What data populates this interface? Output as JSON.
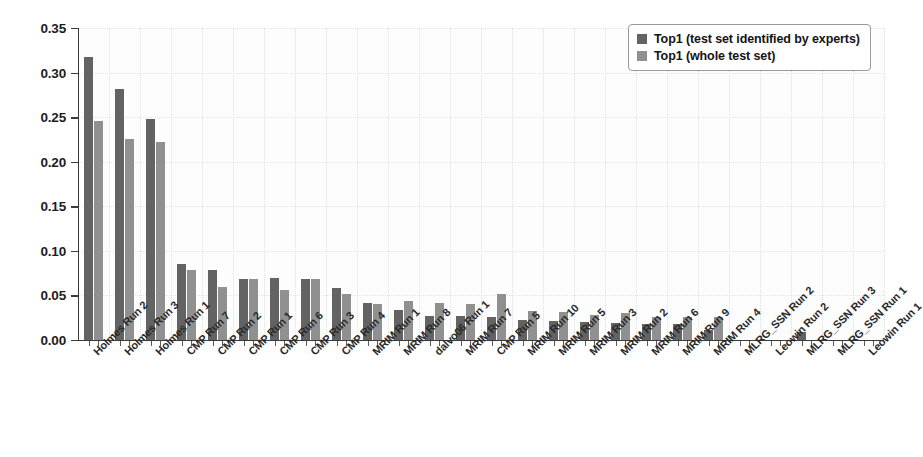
{
  "chart_data": {
    "type": "bar",
    "title": "",
    "subtitle": "",
    "xlabel": "",
    "ylabel": "",
    "ylim": [
      0.0,
      0.35
    ],
    "ytick_labels": [
      "0.00",
      "0.05",
      "0.10",
      "0.15",
      "0.20",
      "0.25",
      "0.30",
      "0.35"
    ],
    "ytick_values": [
      0.0,
      0.05,
      0.1,
      0.15,
      0.2,
      0.25,
      0.3,
      0.35
    ],
    "grid": "dotted-light",
    "legend_position": "top-right",
    "categories": [
      "Holmes Run 2",
      "Holmes Run 3",
      "Holmes Run 1",
      "CMP Run 7",
      "CMP Run 2",
      "CMP Run 1",
      "CMP Run 6",
      "CMP Run 3",
      "CMP Run 4",
      "MRIM Run 1",
      "MRIM Run 8",
      "dalvo06 Run 1",
      "MRIM Run 7",
      "CMP Run 5",
      "MRIM Run 10",
      "MRIM Run 5",
      "MRIM Run 3",
      "MRIM Run 2",
      "MRIM Run 6",
      "MRIM Run 9",
      "MRIM Run 4",
      "MLRG_SSN Run 2",
      "Leowin Run 2",
      "MLRG_SSN Run 3",
      "MLRG_SSN Run 1",
      "Leowin Run 1"
    ],
    "series": [
      {
        "name": "Top1 (test set identified by experts)",
        "color": "#636363",
        "values": [
          0.317,
          0.282,
          0.248,
          0.085,
          0.078,
          0.069,
          0.07,
          0.068,
          0.058,
          0.041,
          0.034,
          0.027,
          0.027,
          0.026,
          0.022,
          0.021,
          0.02,
          0.019,
          0.018,
          0.018,
          0.011,
          0.0,
          0.0,
          0.009,
          0.0,
          0.0
        ]
      },
      {
        "name": "Top1 (whole test set)",
        "color": "#909090",
        "values": [
          0.246,
          0.225,
          0.222,
          0.079,
          0.06,
          0.069,
          0.056,
          0.068,
          0.052,
          0.04,
          0.044,
          0.042,
          0.04,
          0.052,
          0.032,
          0.031,
          0.028,
          0.03,
          0.026,
          0.026,
          0.026,
          0.0,
          0.0,
          0.0,
          0.0,
          0.0
        ]
      }
    ]
  },
  "legend": {
    "items": [
      {
        "label": "Top1 (test set identified by experts)",
        "swatch": "dark-gray-swatch"
      },
      {
        "label": "Top1 (whole test set)",
        "swatch": "light-gray-swatch"
      }
    ]
  }
}
